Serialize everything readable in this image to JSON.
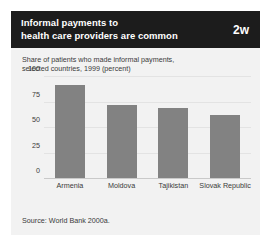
{
  "banner": {
    "title_line1": "Informal payments to",
    "title_line2": "health care providers are common",
    "badge": "2w"
  },
  "subtitle_line1": "Share of patients who made informal payments,",
  "subtitle_line2": "selected countries, 1999 (percent)",
  "source": "Source: World Bank 2000a.",
  "chart_data": {
    "type": "bar",
    "title": "Informal payments to health care providers are common",
    "subtitle": "Share of patients who made informal payments, selected countries, 1999 (percent)",
    "categories": [
      "Armenia",
      "Moldova",
      "Tajikistan",
      "Slovak Republic"
    ],
    "values": [
      91,
      72,
      69,
      62
    ],
    "xlabel": "",
    "ylabel": "",
    "ylim": [
      0,
      100
    ],
    "yticks": [
      0,
      25,
      50,
      75,
      100
    ],
    "ytick_labels": [
      "0",
      "25",
      "50",
      "75",
      "100"
    ],
    "grid": true,
    "legend": false,
    "bar_color": "#828282",
    "source": "Source: World Bank 2000a."
  }
}
